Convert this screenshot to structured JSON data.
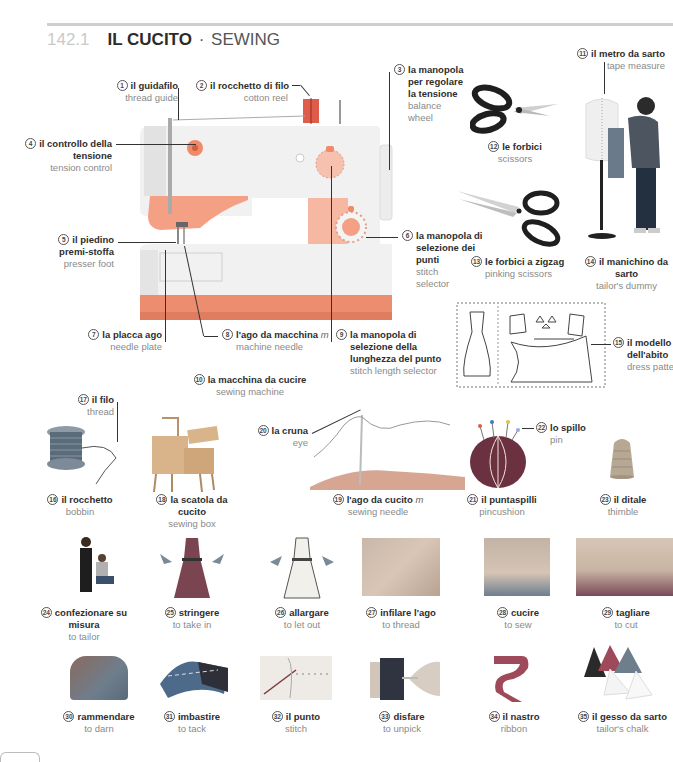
{
  "page": {
    "section_number": "142.1",
    "title_it": "IL CUCITO",
    "separator": "·",
    "title_en": "SEWING"
  },
  "labels": [
    {
      "n": "1",
      "it": "il guidafilo",
      "en": "thread guide"
    },
    {
      "n": "2",
      "it": "il rocchetto di filo",
      "en": "cotton reel"
    },
    {
      "n": "3",
      "it": "la manopola per regolare la tensione",
      "it_lines": [
        "la manopola",
        "per regolare",
        "la tensione"
      ],
      "en": "balance wheel",
      "en_lines": [
        "balance",
        "wheel"
      ]
    },
    {
      "n": "4",
      "it": "il controllo della tensione",
      "it_lines": [
        "il controllo della",
        "tensione"
      ],
      "en": "tension control"
    },
    {
      "n": "5",
      "it": "il piedino premi-stoffa",
      "it_lines": [
        "il piedino",
        "premi-stoffa"
      ],
      "en": "presser foot"
    },
    {
      "n": "6",
      "it": "la manopola di selezione dei punti",
      "it_lines": [
        "la manopola di",
        "selezione dei",
        "punti"
      ],
      "en": "stitch selector",
      "en_lines": [
        "stitch",
        "selector"
      ]
    },
    {
      "n": "7",
      "it": "la placca ago",
      "en": "needle plate"
    },
    {
      "n": "8",
      "it": "l'ago da macchina",
      "gender": "m",
      "en": "machine needle"
    },
    {
      "n": "9",
      "it": "la manopola di selezione della lunghezza del punto",
      "it_lines": [
        "la manopola di",
        "selezione della",
        "lunghezza del punto"
      ],
      "en": "stitch length selector"
    },
    {
      "n": "10",
      "it": "la macchina da cucire",
      "en": "sewing machine"
    },
    {
      "n": "11",
      "it": "il metro da sarto",
      "en": "tape measure"
    },
    {
      "n": "12",
      "it": "le forbici",
      "en": "scissors"
    },
    {
      "n": "13",
      "it": "le forbici a zigzag",
      "en": "pinking scissors"
    },
    {
      "n": "14",
      "it": "il manichino da sarto",
      "it_lines": [
        "il manichino da",
        "sarto"
      ],
      "en": "tailor's dummy"
    },
    {
      "n": "15",
      "it": "il modello dell'abito",
      "it_lines": [
        "il modello",
        "dell'abito"
      ],
      "en": "dress pattern"
    },
    {
      "n": "16",
      "it": "il rocchetto",
      "en": "bobbin"
    },
    {
      "n": "17",
      "it": "il filo",
      "en": "thread"
    },
    {
      "n": "18",
      "it": "la scatola da cucito",
      "it_lines": [
        "la scatola da",
        "cucito"
      ],
      "en": "sewing box"
    },
    {
      "n": "19",
      "it": "l'ago da cucito",
      "gender": "m",
      "en": "sewing needle"
    },
    {
      "n": "20",
      "it": "la cruna",
      "en": "eye"
    },
    {
      "n": "21",
      "it": "il puntaspilli",
      "en": "pincushion"
    },
    {
      "n": "22",
      "it": "lo spillo",
      "en": "pin"
    },
    {
      "n": "23",
      "it": "il ditale",
      "en": "thimble"
    },
    {
      "n": "24",
      "it": "confezionare su misura",
      "it_lines": [
        "confezionare su",
        "misura"
      ],
      "en": "to tailor"
    },
    {
      "n": "25",
      "it": "stringere",
      "en": "to take in"
    },
    {
      "n": "26",
      "it": "allargare",
      "en": "to let out"
    },
    {
      "n": "27",
      "it": "infilare l'ago",
      "en": "to thread"
    },
    {
      "n": "28",
      "it": "cucire",
      "en": "to sew"
    },
    {
      "n": "29",
      "it": "tagliare",
      "en": "to cut"
    },
    {
      "n": "30",
      "it": "rammendare",
      "en": "to darn"
    },
    {
      "n": "31",
      "it": "imbastire",
      "en": "to tack"
    },
    {
      "n": "32",
      "it": "il punto",
      "en": "stitch"
    },
    {
      "n": "33",
      "it": "disfare",
      "en": "to unpick"
    },
    {
      "n": "34",
      "it": "il nastro",
      "en": "ribbon"
    },
    {
      "n": "35",
      "it": "il gesso da sarto",
      "en": "tailor's chalk"
    }
  ],
  "colors": {
    "machine_body": "#eeeeee",
    "machine_accent": "#f0a48a",
    "machine_base": "#ea8a6e",
    "dial": "#f4b39c",
    "title_number": "#c9c9c9",
    "rule": "#cfcfcf",
    "fabric_blue": "#3a6b91",
    "pincushion": "#6b3c4f"
  }
}
